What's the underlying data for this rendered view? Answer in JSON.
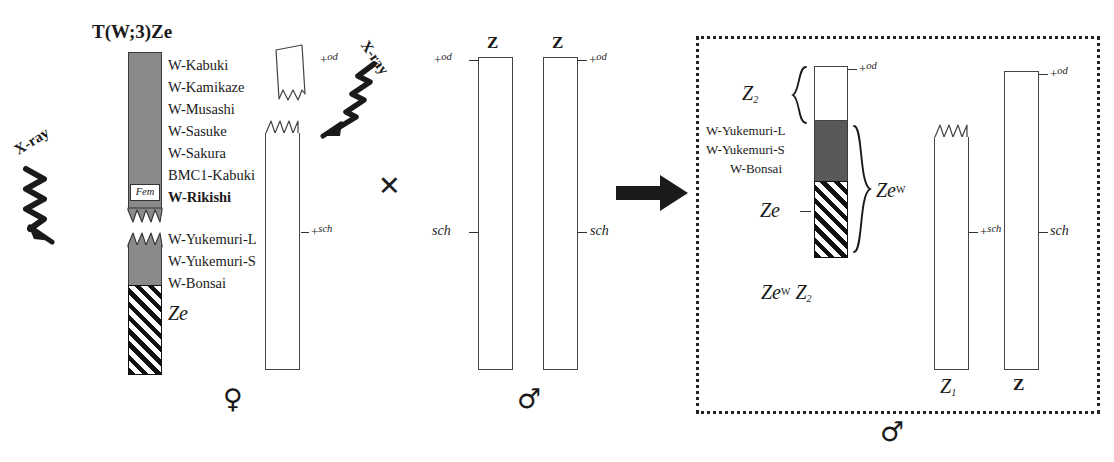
{
  "figure": {
    "type": "genetics-cross-diagram",
    "organism_sex_symbols": {
      "female": "♀",
      "male": "♂"
    }
  },
  "colors": {
    "gray_light": "#8a8a8a",
    "gray_dark": "#595959",
    "outline": "#3a3a3a",
    "ink": "#1a1a1a",
    "box_border": "#222222"
  },
  "parent_female": {
    "sex_symbol": "♀",
    "translocation_title_prefix": "T(W;3)",
    "translocation_title_gene": "Ze",
    "xray_label": "X-ray",
    "w_chromosome_markers": [
      "W-Kabuki",
      "W-Kamikaze",
      "W-Musashi",
      "W-Sasuke",
      "W-Sakura",
      "BMC1-Kabuki",
      "W-Rikishi"
    ],
    "fem_box_label": "Fem",
    "lower_markers": [
      "W-Yukemuri-L",
      "W-Yukemuri-S",
      "W-Bonsai"
    ],
    "ze_label": "Ze",
    "z_chromosome": {
      "top_allele": "+od",
      "mid_allele": "+sch"
    }
  },
  "parent_male": {
    "sex_symbol": "♂",
    "xray_label": "X-ray",
    "chromosomes": [
      {
        "name": "Z",
        "top_allele": "+od",
        "mid_allele": "sch"
      },
      {
        "name": "Z",
        "top_allele": "+od",
        "mid_allele": "sch"
      }
    ]
  },
  "cross_symbol": "✕",
  "result": {
    "sex_symbol": "♂",
    "genotype_prefix": "Ze",
    "genotype_super": "W",
    "genotype_second": "Z",
    "genotype_second_sub": "2",
    "composite_chromosome": {
      "z2_label": "Z",
      "z2_sub": "2",
      "top_allele": "+od",
      "markers": [
        "W-Yukemuri-L",
        "W-Yukemuri-S",
        "W-Bonsai"
      ],
      "ze_label": "Ze",
      "brace_label_prefix": "Ze",
      "brace_label_super": "W"
    },
    "chromosomes": [
      {
        "name": "Z",
        "name_sub": "1",
        "mid_allele": "+sch",
        "broken_top": true
      },
      {
        "name": "Z",
        "name_sub": "",
        "mid_allele": "sch",
        "broken_top": false
      }
    ]
  }
}
